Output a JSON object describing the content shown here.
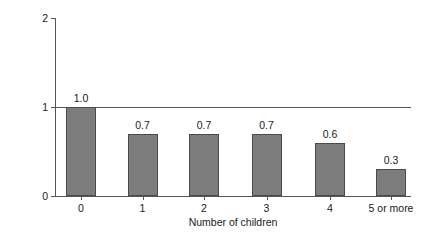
{
  "chart_data": {
    "type": "bar",
    "title": "",
    "categories": [
      "0",
      "1",
      "2",
      "3",
      "4",
      "5 or more"
    ],
    "values": [
      1.0,
      0.7,
      0.7,
      0.7,
      0.6,
      0.3
    ],
    "value_labels": [
      "1.0",
      "0.7",
      "0.7",
      "0.7",
      "0.6",
      "0.3"
    ],
    "xlabel": "Number of children",
    "ylabel": "Relative risk of endometrial cancer",
    "ylim": [
      0,
      2
    ],
    "yticks": [
      0,
      1,
      2
    ],
    "ytick_labels": [
      "0",
      "1",
      "2"
    ],
    "grid": false,
    "legend": null,
    "reference_line": 1.0,
    "bar_color": "#7d7d7d",
    "bar_edge_color": "#4a4a4a",
    "axis_color": "#555555",
    "background_color": "#ffffff"
  }
}
